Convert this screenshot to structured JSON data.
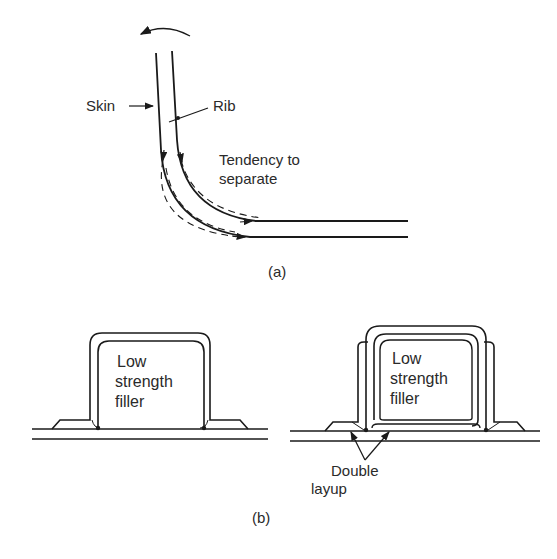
{
  "figure": {
    "part_a": {
      "sublabel": "(a)",
      "labels": {
        "skin": "Skin",
        "rib": "Rib",
        "tendency_line1": "Tendency to",
        "tendency_line2": "separate"
      },
      "icons": [
        "rotation-arrow-icon",
        "pointer-arrow-icon"
      ]
    },
    "part_b": {
      "sublabel": "(b)",
      "left_section": {
        "filler_line1": "Low",
        "filler_line2": "strength",
        "filler_line3": "filler"
      },
      "right_section": {
        "filler_line1": "Low",
        "filler_line2": "strength",
        "filler_line3": "filler",
        "callout_line1": "Double",
        "callout_line2": "layup"
      }
    },
    "caption": {
      "text": "",
      "note": "caption line clipped at image bottom edge; only glyph tops visible, text not legible"
    },
    "colors": {
      "ink": "#1a1a1a",
      "background": "#ffffff"
    }
  }
}
